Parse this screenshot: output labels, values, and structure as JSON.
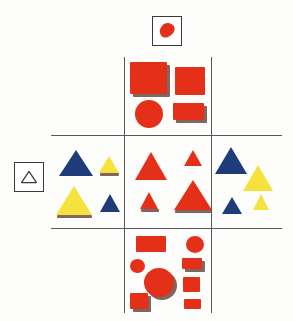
{
  "diagram": {
    "type": "feature-conjunction-matrix",
    "background_color": "#fdfdfb",
    "grid": {
      "line_color": "#58585a",
      "line_width": 1.3,
      "vertical_lines": [
        {
          "name": "vertical-line-left",
          "x": 124,
          "y1": 57,
          "y2": 313
        },
        {
          "name": "vertical-line-right",
          "x": 211,
          "y1": 57,
          "y2": 313
        }
      ],
      "horizontal_lines": [
        {
          "name": "horizontal-line-top",
          "y": 135,
          "x1": 51,
          "x2": 282
        },
        {
          "name": "horizontal-line-bottom",
          "y": 228,
          "x1": 51,
          "x2": 282
        }
      ]
    },
    "legends": {
      "column_legend": {
        "label": "red-blob",
        "icon": "red-irregular-blob-icon",
        "fill": "#E53019",
        "position": "top-center",
        "box": {
          "x": 152,
          "y": 16,
          "w": 30,
          "h": 30
        },
        "description": "Irregular red blob marking the red-colour column"
      },
      "row_legend": {
        "label": "outline-triangle",
        "icon": "outline-triangle-icon",
        "stroke": "#3a3a3a",
        "fill": "none",
        "position": "left-middle",
        "box": {
          "x": 14,
          "y": 162,
          "w": 30,
          "h": 30
        },
        "description": "Unfilled outlined triangle marking the triangle-shape row"
      }
    },
    "colors": {
      "red": "#E53019",
      "blue": "#1F3C7A",
      "yellow": "#F5E23C",
      "shadow": "#6b4a44",
      "line": "#58585a",
      "paper": "#fdfdfb",
      "ink": "#3a3a3a"
    },
    "cells": [
      {
        "name": "cell-top-center",
        "row": "top",
        "column": "center",
        "content_rule": "red, various shapes",
        "shapes": [
          {
            "name": "red-square-large",
            "kind": "square",
            "color": "#E53019",
            "x": 130,
            "y": 62,
            "w": 37,
            "h": 32,
            "shadow": true
          },
          {
            "name": "red-square-medium",
            "kind": "square",
            "color": "#E53019",
            "x": 175,
            "y": 67,
            "w": 30,
            "h": 28,
            "shadow": false
          },
          {
            "name": "red-circle",
            "kind": "circle",
            "color": "#E53019",
            "x": 135,
            "y": 100,
            "w": 28,
            "h": 28,
            "shadow": false
          },
          {
            "name": "red-rectangle",
            "kind": "rectangle",
            "color": "#E53019",
            "x": 173,
            "y": 103,
            "w": 31,
            "h": 17,
            "shadow": true
          }
        ]
      },
      {
        "name": "cell-middle-left",
        "row": "middle",
        "column": "left",
        "content_rule": "triangles, various colours",
        "shapes": [
          {
            "name": "blue-triangle-large",
            "kind": "triangle",
            "color": "#1F3C7A",
            "x": 59,
            "y": 150,
            "w": 34,
            "h": 26,
            "shadow": false
          },
          {
            "name": "yellow-triangle-small",
            "kind": "triangle",
            "color": "#F5E23C",
            "x": 99,
            "y": 156,
            "w": 20,
            "h": 17,
            "shadow": true
          },
          {
            "name": "yellow-triangle-large",
            "kind": "triangle",
            "color": "#F5E23C",
            "x": 56,
            "y": 186,
            "w": 36,
            "h": 29,
            "shadow": true
          },
          {
            "name": "blue-triangle-small",
            "kind": "triangle",
            "color": "#1F3C7A",
            "x": 100,
            "y": 194,
            "w": 20,
            "h": 18,
            "shadow": false
          }
        ]
      },
      {
        "name": "cell-middle-center",
        "row": "middle",
        "column": "center",
        "content_rule": "red triangles (conjunction cell)",
        "shapes": [
          {
            "name": "red-triangle-medium",
            "kind": "triangle",
            "color": "#E53019",
            "x": 135,
            "y": 152,
            "w": 32,
            "h": 28,
            "shadow": false
          },
          {
            "name": "red-triangle-small-top",
            "kind": "triangle",
            "color": "#E53019",
            "x": 184,
            "y": 150,
            "w": 19,
            "h": 16,
            "shadow": false
          },
          {
            "name": "red-triangle-small-bottom",
            "kind": "triangle",
            "color": "#E53019",
            "x": 140,
            "y": 192,
            "w": 19,
            "h": 17,
            "shadow": true
          },
          {
            "name": "red-triangle-large",
            "kind": "triangle",
            "color": "#E53019",
            "x": 174,
            "y": 180,
            "w": 38,
            "h": 30,
            "shadow": true
          }
        ]
      },
      {
        "name": "cell-middle-right",
        "row": "middle",
        "column": "right",
        "content_rule": "triangles, various colours",
        "shapes": [
          {
            "name": "blue-triangle-large-right",
            "kind": "triangle",
            "color": "#1F3C7A",
            "x": 215,
            "y": 147,
            "w": 32,
            "h": 27,
            "shadow": false
          },
          {
            "name": "yellow-triangle-large-right",
            "kind": "triangle",
            "color": "#F5E23C",
            "x": 243,
            "y": 165,
            "w": 30,
            "h": 26,
            "shadow": false
          },
          {
            "name": "blue-triangle-small-right",
            "kind": "triangle",
            "color": "#1F3C7A",
            "x": 222,
            "y": 197,
            "w": 20,
            "h": 17,
            "shadow": false
          },
          {
            "name": "yellow-triangle-small-right",
            "kind": "triangle",
            "color": "#F5E23C",
            "x": 253,
            "y": 194,
            "w": 17,
            "h": 16,
            "shadow": false
          }
        ]
      },
      {
        "name": "cell-bottom-center",
        "row": "bottom",
        "column": "center",
        "content_rule": "red, various shapes",
        "shapes": [
          {
            "name": "red-rectangle-wide",
            "kind": "rectangle",
            "color": "#E53019",
            "x": 136,
            "y": 236,
            "w": 30,
            "h": 16,
            "shadow": false
          },
          {
            "name": "red-circle-small-top",
            "kind": "circle",
            "color": "#E53019",
            "x": 186,
            "y": 236,
            "w": 18,
            "h": 17,
            "shadow": false
          },
          {
            "name": "red-circle-tiny",
            "kind": "circle",
            "color": "#E53019",
            "x": 130,
            "y": 259,
            "w": 15,
            "h": 14,
            "shadow": false
          },
          {
            "name": "red-rectangle-small",
            "kind": "rectangle",
            "color": "#E53019",
            "x": 182,
            "y": 258,
            "w": 20,
            "h": 11,
            "shadow": true
          },
          {
            "name": "red-circle-large",
            "kind": "circle",
            "color": "#E53019",
            "x": 144,
            "y": 268,
            "w": 30,
            "h": 29,
            "shadow": true
          },
          {
            "name": "red-square-small",
            "kind": "square",
            "color": "#E53019",
            "x": 183,
            "y": 277,
            "w": 17,
            "h": 15,
            "shadow": false
          },
          {
            "name": "red-square-bottom",
            "kind": "square",
            "color": "#E53019",
            "x": 130,
            "y": 293,
            "w": 18,
            "h": 16,
            "shadow": true
          },
          {
            "name": "red-rectangle-bottom",
            "kind": "rectangle",
            "color": "#E53019",
            "x": 184,
            "y": 299,
            "w": 17,
            "h": 10,
            "shadow": false
          }
        ]
      }
    ]
  }
}
